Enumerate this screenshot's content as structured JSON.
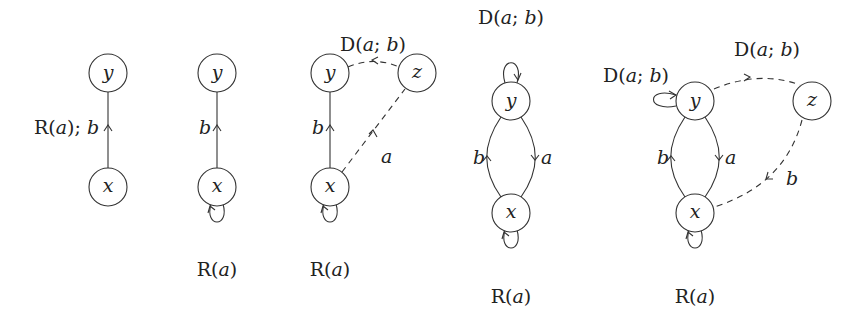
{
  "diagrams": [
    {
      "id": "graph-1",
      "nodes": [
        {
          "name": "y",
          "label": "y"
        },
        {
          "name": "x",
          "label": "x"
        }
      ],
      "edges": [
        {
          "from": "x",
          "to": "y",
          "style": "solid",
          "label_prefix": "R(",
          "label_var": "a",
          "label_suffix": "); ",
          "label_var2": "b"
        }
      ]
    },
    {
      "id": "graph-2",
      "nodes": [
        {
          "name": "y",
          "label": "y"
        },
        {
          "name": "x",
          "label": "x"
        }
      ],
      "edges": [
        {
          "from": "x",
          "to": "y",
          "style": "solid",
          "label": "b"
        },
        {
          "from": "x",
          "to": "x",
          "style": "loop",
          "label_prefix": "R(",
          "label_var": "a",
          "label_suffix": ")"
        }
      ]
    },
    {
      "id": "graph-3",
      "nodes": [
        {
          "name": "y",
          "label": "y"
        },
        {
          "name": "z",
          "label": "z"
        },
        {
          "name": "x",
          "label": "x"
        }
      ],
      "edges": [
        {
          "from": "x",
          "to": "y",
          "style": "solid",
          "label": "b"
        },
        {
          "from": "z",
          "to": "y",
          "style": "dashed",
          "label_prefix": "D(",
          "label_var": "a",
          "label_sep": "; ",
          "label_var2": "b",
          "label_suffix": ")"
        },
        {
          "from": "x",
          "to": "z",
          "style": "dashed",
          "label": "a"
        },
        {
          "from": "x",
          "to": "x",
          "style": "loop",
          "label_prefix": "R(",
          "label_var": "a",
          "label_suffix": ")"
        }
      ]
    },
    {
      "id": "graph-4",
      "nodes": [
        {
          "name": "y",
          "label": "y"
        },
        {
          "name": "x",
          "label": "x"
        }
      ],
      "edges": [
        {
          "from": "y",
          "to": "y",
          "style": "loop",
          "label_prefix": "D(",
          "label_var": "a",
          "label_sep": "; ",
          "label_var2": "b",
          "label_suffix": ")"
        },
        {
          "from": "x",
          "to": "y",
          "style": "curved",
          "label": "b"
        },
        {
          "from": "y",
          "to": "x",
          "style": "curved",
          "label": "a"
        },
        {
          "from": "x",
          "to": "x",
          "style": "loop",
          "label_prefix": "R(",
          "label_var": "a",
          "label_suffix": ")"
        }
      ]
    },
    {
      "id": "graph-5",
      "nodes": [
        {
          "name": "y",
          "label": "y"
        },
        {
          "name": "z",
          "label": "z"
        },
        {
          "name": "x",
          "label": "x"
        }
      ],
      "edges": [
        {
          "from": "y",
          "to": "y",
          "style": "loop",
          "label_prefix": "D(",
          "label_var": "a",
          "label_sep": "; ",
          "label_var2": "b",
          "label_suffix": ")"
        },
        {
          "from": "y",
          "to": "z",
          "style": "dashed",
          "label_prefix": "D(",
          "label_var": "a",
          "label_sep": "; ",
          "label_var2": "b",
          "label_suffix": ")"
        },
        {
          "from": "x",
          "to": "y",
          "style": "curved",
          "label": "b"
        },
        {
          "from": "y",
          "to": "x",
          "style": "curved",
          "label": "a"
        },
        {
          "from": "z",
          "to": "x",
          "style": "dashed",
          "label": "b"
        },
        {
          "from": "x",
          "to": "x",
          "style": "loop",
          "label_prefix": "R(",
          "label_var": "a",
          "label_suffix": ")"
        }
      ]
    }
  ]
}
